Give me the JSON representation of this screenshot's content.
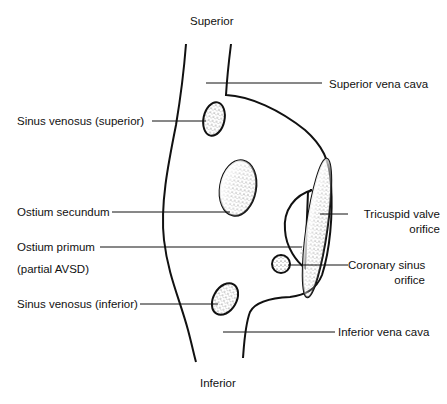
{
  "diagram": {
    "orientation": {
      "top": "Superior",
      "bottom": "Inferior"
    },
    "labels": {
      "svc": "Superior vena cava",
      "sv_superior": "Sinus venosus (superior)",
      "ostium_secundum": "Ostium secundum",
      "ostium_primum_line1": "Ostium primum",
      "ostium_primum_line2": "(partial AVSD)",
      "tricuspid_line1": "Tricuspid valve",
      "tricuspid_line2": "orifice",
      "coronary_line1": "Coronary sinus",
      "coronary_line2": "orifice",
      "sv_inferior": "Sinus venosus (inferior)",
      "ivc": "Inferior vena cava"
    },
    "colors": {
      "stroke": "#111111",
      "stipple": "#333333",
      "background": "#ffffff"
    }
  }
}
